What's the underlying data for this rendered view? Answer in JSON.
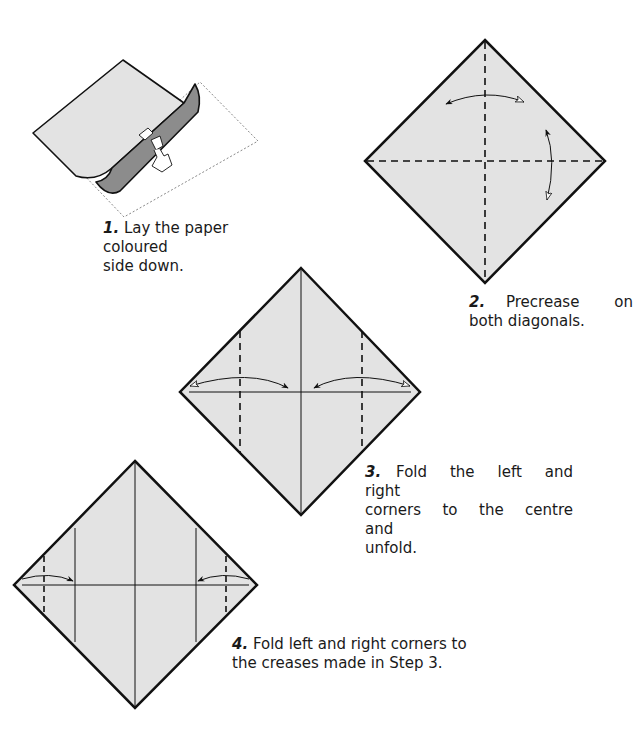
{
  "colors": {
    "paper_white_side": "#e3e3e3",
    "paper_coloured_side": "#8c8c8c",
    "outline": "#111111",
    "background": "#ffffff"
  },
  "steps": [
    {
      "number": "1.",
      "text": "Lay the paper coloured side down.",
      "line1": "Lay the paper coloured",
      "line2": "side down.",
      "diagram": "paper-curl-hand"
    },
    {
      "number": "2.",
      "text": "Precrease on both diagonals.",
      "line1": "Precrease on",
      "line2": "both diagonals.",
      "diagram": "square-valley-creases-diagonals"
    },
    {
      "number": "3.",
      "text": "Fold the left and right corners to the centre and unfold.",
      "line1": "Fold the left and right",
      "line2": "corners to the centre and",
      "line3": "unfold.",
      "diagram": "square-fold-corners-to-centre"
    },
    {
      "number": "4.",
      "text": "Fold left and right corners to the creases made in Step 3.",
      "line1": "Fold left and right corners to",
      "line2": "the creases made in Step 3.",
      "diagram": "square-fold-corners-to-creases"
    }
  ]
}
